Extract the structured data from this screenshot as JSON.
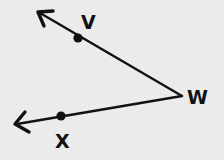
{
  "diagram": {
    "type": "angle",
    "vertex": {
      "label": "W",
      "x": 182,
      "y": 96
    },
    "rays": [
      {
        "name": "ray-WV",
        "from": "W",
        "through": "V",
        "arrow_tip": {
          "x": 38,
          "y": 12
        }
      },
      {
        "name": "ray-WX",
        "from": "W",
        "through": "X",
        "arrow_tip": {
          "x": 15,
          "y": 124
        }
      }
    ],
    "points": [
      {
        "label": "V",
        "x": 78,
        "y": 38,
        "label_x": 81,
        "label_y": 29
      },
      {
        "label": "X",
        "x": 61,
        "y": 116,
        "label_x": 55,
        "label_y": 148
      },
      {
        "label": "W",
        "x": 182,
        "y": 96,
        "label_x": 187,
        "label_y": 104
      }
    ],
    "colors": {
      "stroke": "#111111",
      "background": "#ebebeb"
    }
  }
}
